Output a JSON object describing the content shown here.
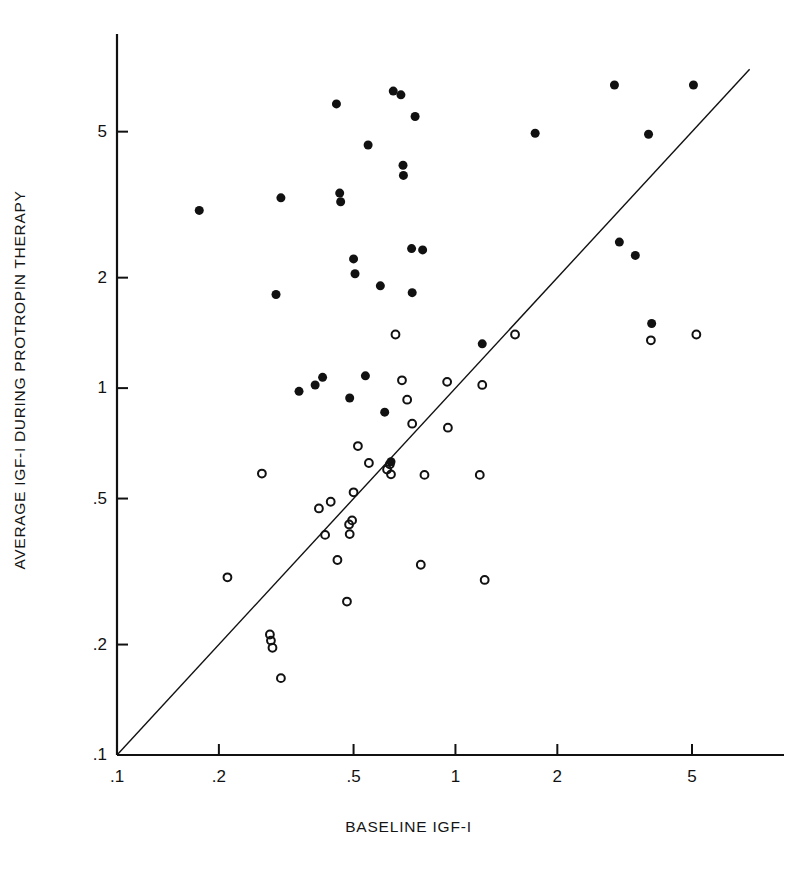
{
  "figure": {
    "background": "#ffffff",
    "ink_color": "#111111"
  },
  "chart_data": {
    "type": "scatter",
    "title": "",
    "xlabel": "BASELINE IGF-I",
    "ylabel": "AVERAGE IGF-I DURING PROTROPIN THERAPY",
    "xscale": "log",
    "yscale": "log",
    "xlim": [
      0.1,
      8.5
    ],
    "ylim": [
      0.1,
      9.0
    ],
    "grid": false,
    "legend_position": "none",
    "xticks": [
      ".1",
      ".2",
      ".5",
      "1",
      "2",
      "5"
    ],
    "xtick_values": [
      0.1,
      0.2,
      0.5,
      1,
      2,
      5
    ],
    "yticks": [
      ".1",
      ".2",
      ".5",
      "1",
      "2",
      "5"
    ],
    "ytick_values": [
      0.1,
      0.2,
      0.5,
      1,
      2,
      5
    ],
    "reference_line": {
      "description": "line of identity y = x",
      "from": [
        0.1,
        0.1
      ],
      "to": [
        7.4,
        7.4
      ],
      "color": "#111111",
      "width": 1.4
    },
    "series": [
      {
        "name": "filled-circles",
        "marker": "filled-circle",
        "color": "#111111",
        "size": 9,
        "points": [
          [
            0.175,
            3.05
          ],
          [
            0.295,
            1.8
          ],
          [
            0.305,
            3.3
          ],
          [
            0.345,
            0.98
          ],
          [
            0.385,
            1.02
          ],
          [
            0.405,
            1.07
          ],
          [
            0.445,
            5.95
          ],
          [
            0.455,
            3.4
          ],
          [
            0.458,
            3.22
          ],
          [
            0.487,
            0.94
          ],
          [
            0.5,
            2.25
          ],
          [
            0.505,
            2.05
          ],
          [
            0.542,
            1.08
          ],
          [
            0.552,
            4.6
          ],
          [
            0.6,
            1.9
          ],
          [
            0.618,
            0.86
          ],
          [
            0.645,
            0.63
          ],
          [
            0.655,
            6.45
          ],
          [
            0.69,
            6.3
          ],
          [
            0.7,
            4.05
          ],
          [
            0.702,
            3.8
          ],
          [
            0.742,
            2.4
          ],
          [
            0.745,
            1.82
          ],
          [
            0.76,
            5.5
          ],
          [
            0.8,
            2.38
          ],
          [
            1.2,
            1.32
          ],
          [
            1.72,
            4.95
          ],
          [
            2.95,
            6.7
          ],
          [
            3.05,
            2.5
          ],
          [
            3.4,
            2.3
          ],
          [
            3.72,
            4.92
          ],
          [
            3.8,
            1.5
          ],
          [
            5.05,
            6.7
          ]
        ]
      },
      {
        "name": "open-circles",
        "marker": "open-circle",
        "color": "#111111",
        "size": 9,
        "points": [
          [
            0.212,
            0.305
          ],
          [
            0.268,
            0.585
          ],
          [
            0.283,
            0.213
          ],
          [
            0.285,
            0.205
          ],
          [
            0.288,
            0.196
          ],
          [
            0.305,
            0.162
          ],
          [
            0.395,
            0.47
          ],
          [
            0.412,
            0.398
          ],
          [
            0.428,
            0.49
          ],
          [
            0.448,
            0.34
          ],
          [
            0.478,
            0.262
          ],
          [
            0.485,
            0.425
          ],
          [
            0.487,
            0.4
          ],
          [
            0.495,
            0.436
          ],
          [
            0.5,
            0.52
          ],
          [
            0.515,
            0.695
          ],
          [
            0.555,
            0.625
          ],
          [
            0.628,
            0.6
          ],
          [
            0.64,
            0.62
          ],
          [
            0.645,
            0.582
          ],
          [
            0.665,
            1.4
          ],
          [
            0.695,
            1.05
          ],
          [
            0.72,
            0.93
          ],
          [
            0.745,
            0.8
          ],
          [
            0.79,
            0.33
          ],
          [
            0.81,
            0.58
          ],
          [
            0.945,
            1.04
          ],
          [
            0.95,
            0.78
          ],
          [
            1.18,
            0.58
          ],
          [
            1.2,
            1.02
          ],
          [
            1.22,
            0.3
          ],
          [
            1.5,
            1.4
          ],
          [
            3.78,
            1.35
          ],
          [
            5.15,
            1.4
          ]
        ]
      }
    ]
  },
  "geometry": {
    "plot_left": 117,
    "plot_right": 770,
    "plot_top": 38,
    "plot_bottom": 755
  }
}
